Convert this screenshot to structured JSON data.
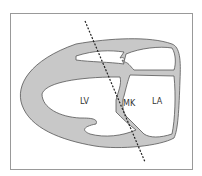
{
  "diagram": {
    "type": "cardiac-cross-section",
    "labels": {
      "lv": "LV",
      "mk": "MK",
      "la": "LA"
    },
    "colors": {
      "wall_fill": "#c8c8c8",
      "outline": "#555555",
      "frame": "#999999",
      "scan_line": "#222222"
    }
  }
}
